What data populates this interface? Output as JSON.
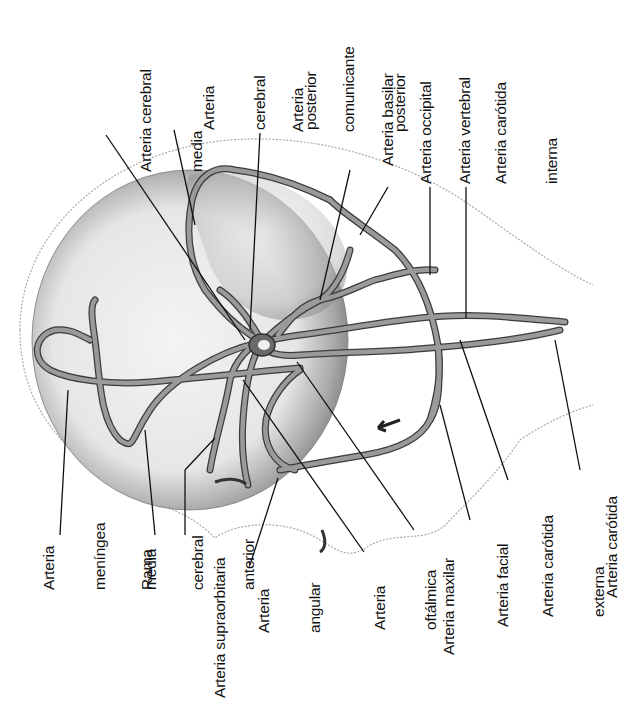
{
  "diagram": {
    "type": "anatomical-illustration",
    "labels": [
      {
        "id": "cerebral_media",
        "lines": [
          "Arteria cerebral",
          "media"
        ],
        "x": 103,
        "y": 170
      },
      {
        "id": "cerebral_posterior",
        "lines": [
          "Arteria",
          "cerebral",
          "posterior"
        ],
        "x": 166,
        "y": 128
      },
      {
        "id": "comunicante_posterior",
        "lines": [
          "Arteria",
          "comunicante",
          "posterior"
        ],
        "x": 255,
        "y": 130
      },
      {
        "id": "basilar",
        "lines": [
          "Arteria basilar"
        ],
        "x": 345,
        "y": 168
      },
      {
        "id": "occipital",
        "lines": [
          "Arteria occipital"
        ],
        "x": 383,
        "y": 185
      },
      {
        "id": "vertebral",
        "lines": [
          "Arteria vertebral"
        ],
        "x": 423,
        "y": 185
      },
      {
        "id": "carotida_interna",
        "lines": [
          "Arteria carótida",
          "interna"
        ],
        "x": 458,
        "y": 185
      },
      {
        "id": "meningea_media",
        "lines": [
          "Arteria",
          "meníngea",
          "media"
        ],
        "x": 6,
        "y": 590
      },
      {
        "id": "rama_cerebral_anterior",
        "lines": [
          "Rama",
          "cerebral",
          "anterior"
        ],
        "x": 105,
        "y": 590
      },
      {
        "id": "supraorbitaria",
        "lines": [
          "Arteria supraorbitaria"
        ],
        "x": 177,
        "y": 697
      },
      {
        "id": "angular",
        "lines": [
          "Arteria",
          "angular"
        ],
        "x": 221,
        "y": 635
      },
      {
        "id": "oftalmica",
        "lines": [
          "Arteria",
          "oftálmica"
        ],
        "x": 337,
        "y": 635
      },
      {
        "id": "maxilar",
        "lines": [
          "Arteria maxilar"
        ],
        "x": 406,
        "y": 655
      },
      {
        "id": "facial",
        "lines": [
          "Arteria facial"
        ],
        "x": 460,
        "y": 627
      },
      {
        "id": "carotida_externa",
        "lines": [
          "Arteria carótida",
          "externa"
        ],
        "x": 505,
        "y": 617
      },
      {
        "id": "carotida",
        "lines": [
          "Arteria carótida"
        ],
        "x": 570,
        "y": 600
      }
    ],
    "colors": {
      "ink": "#111111",
      "vessel": "#8c8c8c",
      "vessel_edge": "#3c3c3c",
      "skull_shade": "#bdbdbd",
      "skin_line": "#a8a8a8"
    }
  }
}
